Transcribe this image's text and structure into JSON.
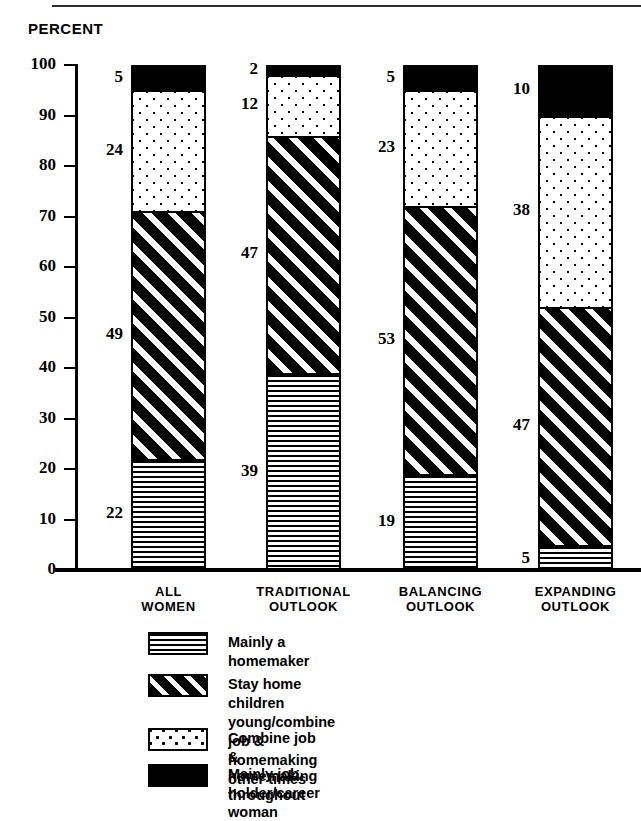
{
  "header": {
    "axis_title": "PERCENT"
  },
  "chart_data": {
    "type": "bar",
    "subtype": "stacked-100",
    "title": "",
    "xlabel": "",
    "ylabel": "PERCENT",
    "ylim": [
      0,
      100
    ],
    "ytick_step": 10,
    "grid": false,
    "legend_position": "bottom",
    "yticks": [
      "100",
      "90",
      "80",
      "70",
      "60",
      "50",
      "40",
      "30",
      "20",
      "10",
      "0"
    ],
    "categories": [
      "ALL WOMEN",
      "TRADITIONAL OUTLOOK",
      "BALANCING OUTLOOK",
      "EXPANDING OUTLOOK"
    ],
    "category_lines": [
      [
        "ALL",
        "WOMEN"
      ],
      [
        "TRADITIONAL",
        "OUTLOOK"
      ],
      [
        "BALANCING",
        "OUTLOOK"
      ],
      [
        "EXPANDING",
        "OUTLOOK"
      ]
    ],
    "series": [
      {
        "name": "Mainly a homemaker",
        "pattern": "horizontal-lines",
        "values": [
          22,
          39,
          19,
          5
        ]
      },
      {
        "name": "Stay home children young/combine job & homemaking other times",
        "pattern": "diagonal-hatch",
        "values": [
          49,
          47,
          53,
          47
        ]
      },
      {
        "name": "Combine job & homemaking throughout",
        "pattern": "dots",
        "values": [
          24,
          12,
          23,
          38
        ]
      },
      {
        "name": "Mainly job holder/career woman",
        "pattern": "solid-black",
        "values": [
          5,
          2,
          5,
          10
        ]
      }
    ]
  },
  "legend": {
    "items": [
      {
        "label": "Mainly a homemaker",
        "pattern": "horizontal-lines"
      },
      {
        "label": "Stay home children young/combine\njob & homemaking other times",
        "pattern": "diagonal-hatch"
      },
      {
        "label": "Combine job & homemaking throughout",
        "pattern": "dots"
      },
      {
        "label": "Mainly job holder/career woman",
        "pattern": "solid-black"
      }
    ]
  },
  "colors": {
    "ink": "#000000",
    "paper": "#ffffff"
  }
}
